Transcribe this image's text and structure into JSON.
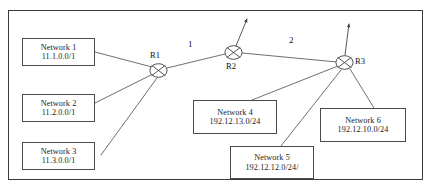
{
  "diagram": {
    "border_color": "#3a3a3a",
    "line_color": "#555555",
    "background": "#ffffff",
    "caption_top": "",
    "caption_bottom": ""
  },
  "routers": [
    {
      "id": "r1",
      "label": "R1",
      "icon": "router-crossed-circle-icon",
      "x": 158,
      "y": 70
    },
    {
      "id": "r2",
      "label": "R2",
      "icon": "router-crossed-circle-icon",
      "x": 233,
      "y": 52
    },
    {
      "id": "r3",
      "label": "R3",
      "icon": "router-crossed-circle-icon",
      "x": 344,
      "y": 62
    }
  ],
  "networks": [
    {
      "id": "network-1",
      "name": "Network 1",
      "address": "11.1.0.0/1",
      "x": 22,
      "y": 38,
      "w": 73,
      "h": 28
    },
    {
      "id": "network-2",
      "name": "Network 2",
      "address": "11.2.0.0/1",
      "x": 22,
      "y": 94,
      "w": 73,
      "h": 28
    },
    {
      "id": "network-3",
      "name": "Network 3",
      "address": "11.3.0.0/1",
      "x": 22,
      "y": 142,
      "w": 73,
      "h": 28
    },
    {
      "id": "network-4",
      "name": "Network 4",
      "address": "192.12.13.0/24",
      "x": 193,
      "y": 100,
      "w": 84,
      "h": 34
    },
    {
      "id": "network-5",
      "name": "Network 5",
      "address": "192.12.12.0/24/",
      "x": 230,
      "y": 146,
      "w": 84,
      "h": 33
    },
    {
      "id": "network-6",
      "name": "Network 6",
      "address": "192.12.10.0/24",
      "x": 320,
      "y": 108,
      "w": 86,
      "h": 34
    }
  ],
  "link_labels": [
    {
      "id": "link-cost-r1-r2",
      "text": "1",
      "x": 188,
      "y": 40
    },
    {
      "id": "link-cost-r2-r3",
      "text": "2",
      "x": 288,
      "y": 36
    }
  ],
  "external_links": [
    {
      "id": "r2-uplink",
      "from": "r2",
      "arrow": "up-right"
    },
    {
      "id": "r3-uplink",
      "from": "r3",
      "arrow": "up"
    }
  ]
}
